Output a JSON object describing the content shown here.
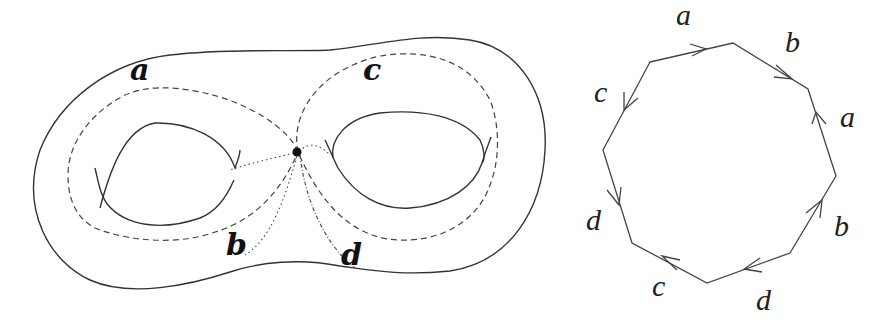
{
  "figure": {
    "surface": {
      "description": "Genus-2 surface with four loops through a base point",
      "labels": {
        "a": "a",
        "b": "b",
        "c": "c",
        "d": "d"
      }
    },
    "polygon": {
      "description": "Octagon with edge identifications",
      "edge_labels": {
        "top": "a",
        "upper_right": "b",
        "right": "a",
        "lower_right": "b",
        "bottom_right": "d",
        "bottom_left": "c",
        "left": "d",
        "upper_left": "c"
      }
    }
  },
  "colors": {
    "stroke": "#444444",
    "background": "#ffffff"
  }
}
